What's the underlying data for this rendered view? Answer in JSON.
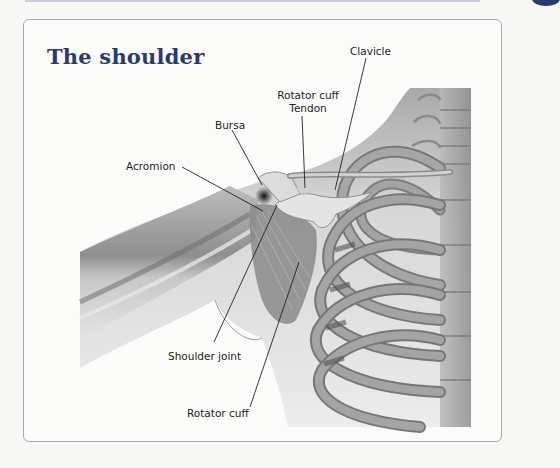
{
  "header": {
    "accent_color": "#2b3a6e"
  },
  "figure": {
    "title": "The shoulder",
    "labels": {
      "clavicle": "Clavicle",
      "rotator_cuff_tendon_line1": "Rotator cuff",
      "rotator_cuff_tendon_line2": "Tendon",
      "bursa": "Bursa",
      "acromion": "Acromion",
      "shoulder_joint": "Shoulder joint",
      "rotator_cuff": "Rotator cuff"
    }
  }
}
